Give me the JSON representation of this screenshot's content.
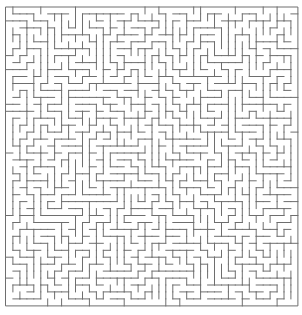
{
  "maze": {
    "cols": 42,
    "rows": 43,
    "cell_px": 6.95,
    "origin_x": 6,
    "origin_y": 7,
    "wall_color": "#6e6e6e",
    "background_color": "#ffffff",
    "wall_width": 1,
    "seed": 1337
  }
}
